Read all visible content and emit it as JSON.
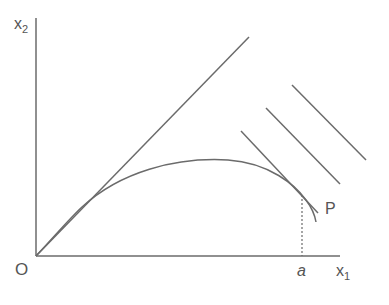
{
  "diagram": {
    "type": "economics-production-diagram",
    "colors": {
      "line": "#6b6b6b",
      "text": "#555555",
      "background": "#ffffff"
    },
    "axes": {
      "y_label": {
        "main": "x",
        "sub": "2"
      },
      "x_label": {
        "main": "x",
        "sub": "1"
      },
      "origin_label": "O"
    },
    "labels": {
      "point": "P",
      "tick_a": "a"
    },
    "elements": [
      {
        "id": "ray-45deg",
        "kind": "line",
        "description": "straight line from origin"
      },
      {
        "id": "curve",
        "kind": "curve",
        "description": "concave curve from origin through P"
      },
      {
        "id": "tangent-line-1",
        "kind": "line",
        "description": "line tangent to curve at P"
      },
      {
        "id": "parallel-line-2",
        "kind": "line",
        "description": "parallel line"
      },
      {
        "id": "parallel-line-3",
        "kind": "line",
        "description": "parallel line"
      },
      {
        "id": "dashed-drop",
        "kind": "dashed-line",
        "description": "vertical dashed line from P to a"
      }
    ]
  }
}
